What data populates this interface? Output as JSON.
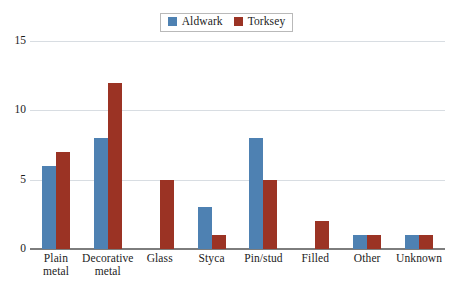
{
  "legend": {
    "position": "top-center",
    "entries": [
      {
        "label": "Aldwark",
        "color": "#4E81B2",
        "swatch_name": "legend-swatch-aldwark"
      },
      {
        "label": "Torksey",
        "color": "#9B3324",
        "swatch_name": "legend-swatch-torksey"
      }
    ]
  },
  "axes": {
    "yticks": [
      "0",
      "5",
      "10",
      "15"
    ],
    "xticks": [
      "Plain metal",
      "Decorative metal",
      "Glass",
      "Styca",
      "Pin/stud",
      "Filled",
      "Other",
      "Unknown"
    ]
  },
  "chart_data": {
    "type": "bar",
    "title": "",
    "subtitle": "",
    "xlabel": "",
    "ylabel": "",
    "ylim": [
      0,
      15
    ],
    "yticks": [
      0,
      5,
      10,
      15
    ],
    "grid": true,
    "legend_position": "top-center",
    "categories": [
      "Plain metal",
      "Decorative metal",
      "Glass",
      "Styca",
      "Pin/stud",
      "Filled",
      "Other",
      "Unknown"
    ],
    "series": [
      {
        "name": "Aldwark",
        "color": "#4E81B2",
        "values": [
          6,
          8,
          0,
          3,
          8,
          0,
          1,
          1
        ]
      },
      {
        "name": "Torksey",
        "color": "#9B3324",
        "values": [
          7,
          12,
          5,
          1,
          5,
          2,
          1,
          1
        ]
      }
    ]
  }
}
